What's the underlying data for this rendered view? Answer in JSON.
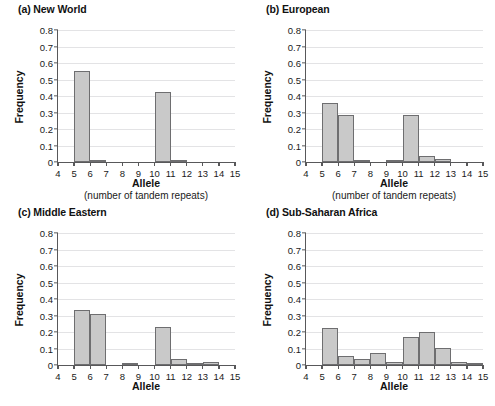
{
  "figure": {
    "axis": {
      "ylabel": "Frequency",
      "xlabel": "Allele",
      "xsublabel": "(number of tandem repeats)",
      "ylim": [
        0,
        0.8
      ],
      "ytick_labels": [
        "0",
        "0.1",
        "0.2",
        "0.3",
        "0.4",
        "0.5",
        "0.6",
        "0.7",
        "0.8"
      ],
      "ytick_values": [
        0,
        0.1,
        0.2,
        0.3,
        0.4,
        0.5,
        0.6,
        0.7,
        0.8
      ],
      "xtick_labels": [
        "4",
        "5",
        "6",
        "7",
        "8",
        "9",
        "10",
        "11",
        "12",
        "13",
        "14",
        "15"
      ],
      "xtick_values": [
        4,
        5,
        6,
        7,
        8,
        9,
        10,
        11,
        12,
        13,
        14,
        15
      ]
    },
    "colors": {
      "bar_fill": "#c9c9c9",
      "bar_stroke": "#6e6e70",
      "axis": "#58585a",
      "grid": "#e3e3e5",
      "text": "#111111"
    }
  },
  "chart_data": [
    {
      "type": "bar",
      "panel": "a",
      "title": "(a) New World",
      "xlabel": "Allele",
      "xsublabel": "(number of tandem repeats)",
      "ylabel": "Frequency",
      "ylim": [
        0,
        0.8
      ],
      "grid": true,
      "legend": "none",
      "categories": [
        4,
        5,
        6,
        7,
        8,
        9,
        10,
        11,
        12,
        13,
        14,
        15
      ],
      "values": [
        0,
        0.55,
        0.015,
        0,
        0,
        0,
        0.425,
        0.012,
        0,
        0,
        0,
        0
      ]
    },
    {
      "type": "bar",
      "panel": "b",
      "title": "(b) European",
      "xlabel": "Allele",
      "xsublabel": "(number of tandem repeats)",
      "ylabel": "Frequency",
      "ylim": [
        0,
        0.8
      ],
      "grid": true,
      "legend": "none",
      "categories": [
        4,
        5,
        6,
        7,
        8,
        9,
        10,
        11,
        12,
        13,
        14,
        15
      ],
      "values": [
        0,
        0.355,
        0.285,
        0.008,
        0,
        0.008,
        0.285,
        0.037,
        0.02,
        0,
        0,
        0
      ]
    },
    {
      "type": "bar",
      "panel": "c",
      "title": "(c) Middle Eastern",
      "xlabel": "Allele",
      "ylabel": "Frequency",
      "ylim": [
        0,
        0.8
      ],
      "grid": true,
      "legend": "none",
      "categories": [
        4,
        5,
        6,
        7,
        8,
        9,
        10,
        11,
        12,
        13,
        14,
        15
      ],
      "values": [
        0,
        0.333,
        0.312,
        0,
        0.008,
        0,
        0.232,
        0.038,
        0.012,
        0.02,
        0,
        0
      ]
    },
    {
      "type": "bar",
      "panel": "d",
      "title": "(d) Sub-Saharan Africa",
      "xlabel": "Allele",
      "ylabel": "Frequency",
      "ylim": [
        0,
        0.8
      ],
      "grid": true,
      "legend": "none",
      "categories": [
        4,
        5,
        6,
        7,
        8,
        9,
        10,
        11,
        12,
        13,
        14,
        15
      ],
      "values": [
        0,
        0.227,
        0.057,
        0.035,
        0.07,
        0.02,
        0.167,
        0.202,
        0.103,
        0.02,
        0.01,
        0
      ]
    }
  ]
}
